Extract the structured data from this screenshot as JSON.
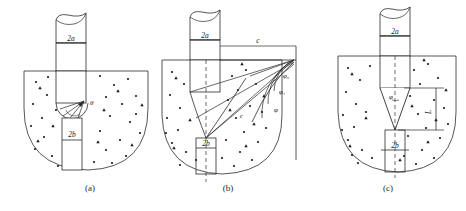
{
  "figure": {
    "type": "engineering-diagram",
    "panel_count": 3
  },
  "panels": [
    {
      "id": "a",
      "caption": "(a)",
      "caption_x": 90,
      "caption_y": 186,
      "labels": {
        "shaft_width": "2a",
        "tip_width": "2b",
        "angle": "θ"
      },
      "description": "pile with semicircular soil failure surface and small slip fan at pile shoulder"
    },
    {
      "id": "b",
      "caption": "(b)",
      "caption_x": 228,
      "caption_y": 186,
      "labels": {
        "shaft_width": "2a",
        "tip_width": "2b",
        "horizontal_dim": "c",
        "angle_0": "φ₀",
        "angle_1": "φ₁",
        "angle_2": "φ",
        "inner_angle": "φ",
        "cohesion": "c"
      },
      "description": "pile with radial slip-line fan converging to a point at ground level, showing friction angles"
    },
    {
      "id": "c",
      "caption": "(c)",
      "caption_x": 388,
      "caption_y": 186,
      "labels": {
        "shaft_width": "2a",
        "tip_width": "2b",
        "cone_angle": "φ",
        "depth_dim": "L"
      },
      "description": "pile with conical wedge failure zone of apex angle phi and depth L"
    }
  ],
  "style": {
    "line_color": "#2b2b2b",
    "soil_dot_color": "#1a1a1a",
    "background": "#ffffff",
    "dash_pattern": "4 3"
  }
}
